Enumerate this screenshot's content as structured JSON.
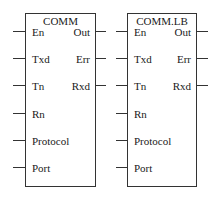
{
  "blocks": [
    {
      "title": "COMM",
      "inputs": [
        "En",
        "Txd",
        "Tn",
        "Rn",
        "Protocol",
        "Port"
      ],
      "outputs": [
        "Out",
        "Err",
        "Rxd"
      ]
    },
    {
      "title": "COMM.LB",
      "inputs": [
        "En",
        "Txd",
        "Tn",
        "Rn",
        "Protocol",
        "Port"
      ],
      "outputs": [
        "Out",
        "Err",
        "Rxd"
      ]
    }
  ]
}
